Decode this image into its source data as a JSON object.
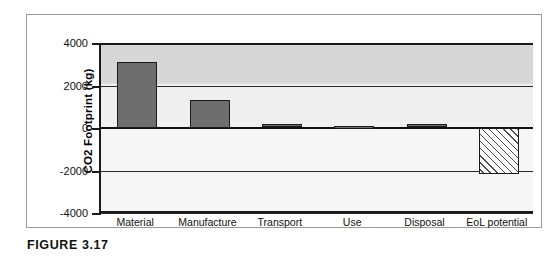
{
  "figure": {
    "caption": "FIGURE 3.17"
  },
  "chart_data": {
    "type": "bar",
    "title": "",
    "xlabel": "",
    "ylabel": "CO2 Footprint (kg)",
    "ylim": [
      -4000,
      4000
    ],
    "yticks": [
      4000,
      2000,
      0,
      -2000,
      -4000
    ],
    "ytick_labels": [
      "4000",
      "2000",
      "0",
      "-2000",
      "-4000"
    ],
    "grid": true,
    "legend": "none",
    "categories": [
      "Material",
      "Manufacture",
      "Transport",
      "Use",
      "Disposal",
      "EoL potential"
    ],
    "values": [
      3100,
      1300,
      80,
      0,
      80,
      -2150
    ],
    "bar_styles": [
      "solid",
      "solid",
      "solid",
      "solid",
      "solid",
      "hatched"
    ],
    "colors": {
      "bar_fill": "#6e6e6e",
      "bar_edge": "#1a1a1a",
      "hatch_line": "#4a4a4a",
      "plot_background_upper": "#d7d7d7",
      "plot_background_mid": "#efefef",
      "plot_background_lower": "#f6f6f6",
      "axis": "#1a1a1a",
      "frame": "#9a9a9a"
    }
  }
}
